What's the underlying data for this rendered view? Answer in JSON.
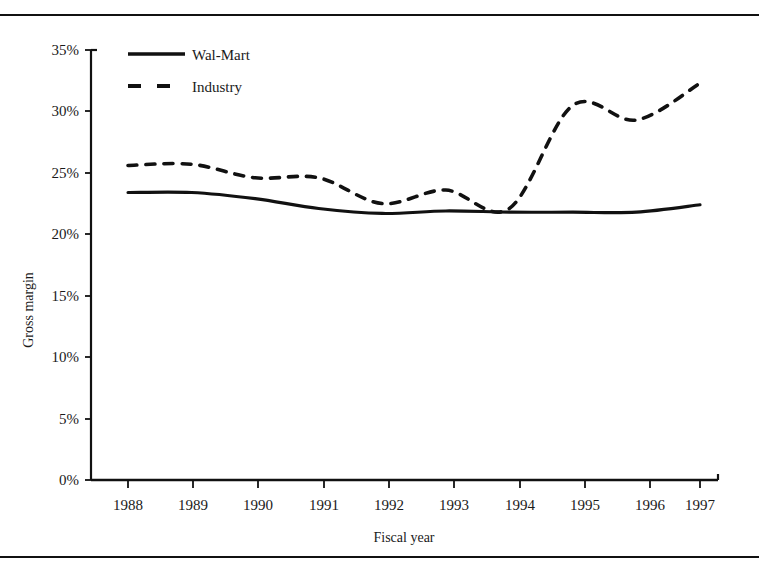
{
  "figure": {
    "clipped_header_text": "",
    "top_rule": true,
    "bottom_rule": true
  },
  "chart_data": {
    "type": "line",
    "title": "",
    "xlabel": "Fiscal year",
    "ylabel": "Gross margin",
    "categories": [
      "1988",
      "1989",
      "1990",
      "1991",
      "1992",
      "1993",
      "1994",
      "1995",
      "1996",
      "1997"
    ],
    "x": [
      1988,
      1989,
      1990,
      1991,
      1992,
      1993,
      1994,
      1995,
      1996,
      1997
    ],
    "xlim": [
      1987.6,
      1997.4
    ],
    "ylim": [
      0,
      35
    ],
    "ytick_labels": [
      "0%",
      "5%",
      "10%",
      "15%",
      "20%",
      "25%",
      "30%",
      "35%"
    ],
    "ytick_values": [
      0,
      5,
      10,
      15,
      20,
      25,
      30,
      35
    ],
    "grid": false,
    "legend_position": "top-left",
    "series": [
      {
        "name": "Wal-Mart",
        "style": "solid",
        "color": "#111111",
        "values": [
          23.4,
          23.4,
          22.9,
          22.1,
          21.7,
          21.9,
          21.8,
          21.8,
          21.8,
          22.4
        ]
      },
      {
        "name": "Industry",
        "style": "dashed",
        "color": "#111111",
        "values": [
          25.6,
          25.7,
          24.6,
          24.6,
          22.5,
          23.6,
          22.1,
          30.5,
          29.3,
          32.3
        ]
      }
    ]
  },
  "legend": {
    "items": [
      {
        "label": "Wal-Mart",
        "style": "solid"
      },
      {
        "label": "Industry",
        "style": "dashed"
      }
    ]
  },
  "axes": {
    "y_axis_title": "Gross margin",
    "x_axis_title": "Fiscal year"
  }
}
